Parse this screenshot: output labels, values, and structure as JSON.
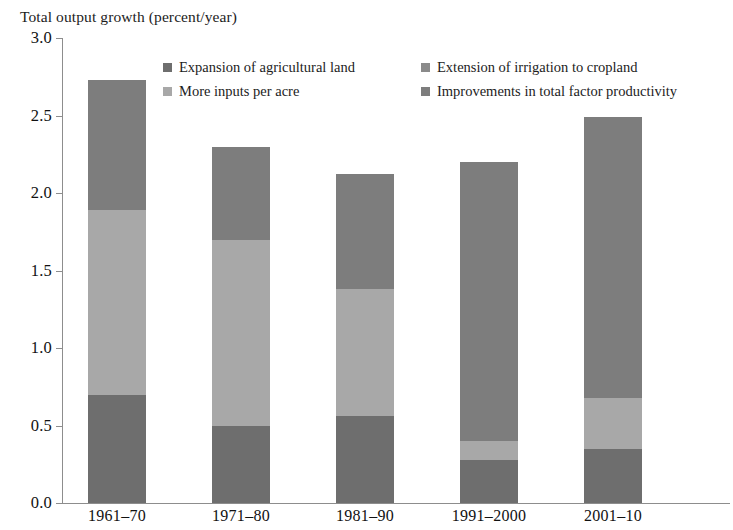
{
  "top_cut_text": "",
  "axis_caption": "Total output growth (percent/year)",
  "legend": {
    "items": [
      {
        "label": "Expansion of agricultural land",
        "color": "#6e6e6e"
      },
      {
        "label": "Extension of irrigation to cropland",
        "color": "#8a8a8a"
      },
      {
        "label": "More inputs per acre",
        "color": "#a8a8a8"
      },
      {
        "label": "Improvements in total factor productivity",
        "color": "#7d7d7d"
      }
    ]
  },
  "chart_data": {
    "type": "bar",
    "subtype": "stacked",
    "title": "",
    "xlabel": "",
    "ylabel": "Total output growth (percent/year)",
    "ylim": [
      0.0,
      3.0
    ],
    "ytick_labels": [
      "3.0",
      "2.5",
      "2.0",
      "1.5",
      "1.0",
      "0.5",
      "0.0"
    ],
    "ytick_values": [
      3.0,
      2.5,
      2.0,
      1.5,
      1.0,
      0.5,
      0.0
    ],
    "grid": false,
    "legend_position": "top-inside",
    "categories": [
      "1961–70",
      "1971–80",
      "1981–90",
      "1991–2000",
      "2001–10"
    ],
    "series": [
      {
        "name": "Expansion of agricultural land",
        "color": "#6e6e6e",
        "values": [
          0.7,
          0.5,
          0.56,
          0.28,
          0.35
        ]
      },
      {
        "name": "Extension of irrigation to cropland",
        "color": "#8a8a8a",
        "values": [
          0.0,
          0.0,
          0.0,
          0.0,
          0.0
        ]
      },
      {
        "name": "More inputs per acre",
        "color": "#a8a8a8",
        "values": [
          1.19,
          1.2,
          0.82,
          0.12,
          0.33
        ]
      },
      {
        "name": "Improvements in total factor productivity",
        "color": "#7d7d7d",
        "values": [
          0.84,
          0.6,
          0.74,
          1.8,
          1.81
        ]
      }
    ],
    "totals": [
      2.73,
      2.3,
      2.12,
      2.2,
      2.49
    ],
    "bars": [
      {
        "category": "1961–70",
        "total": 2.73,
        "segments": [
          {
            "series": "Expansion of agricultural land",
            "value": 0.7,
            "color": "#6e6e6e"
          },
          {
            "series": "More inputs per acre",
            "value": 1.19,
            "color": "#a8a8a8"
          },
          {
            "series": "Improvements in total factor productivity",
            "value": 0.84,
            "color": "#7d7d7d"
          }
        ]
      },
      {
        "category": "1971–80",
        "total": 2.3,
        "segments": [
          {
            "series": "Expansion of agricultural land",
            "value": 0.5,
            "color": "#6e6e6e"
          },
          {
            "series": "More inputs per acre",
            "value": 1.2,
            "color": "#a8a8a8"
          },
          {
            "series": "Improvements in total factor productivity",
            "value": 0.6,
            "color": "#7d7d7d"
          }
        ]
      },
      {
        "category": "1981–90",
        "total": 2.12,
        "segments": [
          {
            "series": "Expansion of agricultural land",
            "value": 0.56,
            "color": "#6e6e6e"
          },
          {
            "series": "More inputs per acre",
            "value": 0.82,
            "color": "#a8a8a8"
          },
          {
            "series": "Improvements in total factor productivity",
            "value": 0.74,
            "color": "#7d7d7d"
          }
        ]
      },
      {
        "category": "1991–2000",
        "total": 2.2,
        "segments": [
          {
            "series": "Expansion of agricultural land",
            "value": 0.28,
            "color": "#6e6e6e"
          },
          {
            "series": "More inputs per acre",
            "value": 0.12,
            "color": "#a8a8a8"
          },
          {
            "series": "Improvements in total factor productivity",
            "value": 1.8,
            "color": "#7d7d7d"
          }
        ]
      },
      {
        "category": "2001–10",
        "total": 2.49,
        "segments": [
          {
            "series": "Expansion of agricultural land",
            "value": 0.35,
            "color": "#6e6e6e"
          },
          {
            "series": "More inputs per acre",
            "value": 0.33,
            "color": "#a8a8a8"
          },
          {
            "series": "Improvements in total factor productivity",
            "value": 1.81,
            "color": "#7d7d7d"
          }
        ]
      }
    ]
  },
  "geometry": {
    "plot_top_y": 38,
    "plot_bottom_y": 503,
    "axis_x": 62,
    "bar_width": 58,
    "bar_left_positions": [
      88,
      212,
      336,
      460,
      584
    ]
  }
}
